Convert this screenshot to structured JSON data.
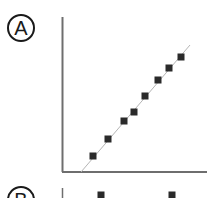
{
  "panels": [
    {
      "label": "A"
    },
    {
      "label": "B"
    }
  ],
  "colors": {
    "axis": "#6e6e6e",
    "line": "#b5b5b5",
    "marker": "#2a2a2a"
  },
  "chart_data": [
    {
      "type": "scatter",
      "panel": "A",
      "title": "",
      "xlabel": "",
      "ylabel": "",
      "grid": false,
      "legend": null,
      "points_px": [
        [
          93,
          156
        ],
        [
          108,
          139
        ],
        [
          124,
          121
        ],
        [
          134,
          112
        ],
        [
          145,
          96
        ],
        [
          158,
          80
        ],
        [
          169,
          68
        ],
        [
          181,
          57
        ]
      ],
      "x": [
        1,
        2,
        3,
        3.7,
        4.4,
        5.2,
        5.9,
        6.7
      ],
      "y": [
        1,
        2,
        3,
        3.5,
        4.4,
        5.3,
        6.0,
        6.6
      ],
      "fit_line": {
        "type": "linear",
        "from_px": [
          81,
          172
        ],
        "to_px": [
          190,
          45
        ]
      }
    },
    {
      "type": "scatter",
      "panel": "B",
      "note": "partially visible, cropped at bottom",
      "points_px": [
        [
          101,
          195
        ],
        [
          172,
          195
        ]
      ]
    }
  ]
}
